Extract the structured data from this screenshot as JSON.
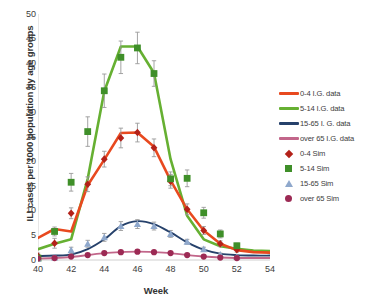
{
  "chart_data": {
    "type": "line",
    "title": "",
    "xlabel": "Week",
    "ylabel": "ILI cases per 1000 population by age groups",
    "xlim": [
      40,
      54
    ],
    "ylim": [
      0,
      50
    ],
    "xticks": [
      40,
      42,
      44,
      46,
      48,
      50,
      52,
      54
    ],
    "yticks": [
      0,
      5,
      10,
      15,
      20,
      25,
      30,
      35,
      40,
      45,
      50
    ],
    "grid": false,
    "legend_position": "right",
    "x": [
      40,
      41,
      42,
      43,
      44,
      45,
      46,
      47,
      48,
      49,
      50,
      51,
      52,
      53,
      54
    ],
    "series": [
      {
        "name": "0-4 I.G. data",
        "kind": "line",
        "color": "#e8491f",
        "values": [
          4.5,
          6.3,
          5.8,
          15.2,
          20.4,
          25.8,
          25.9,
          23.0,
          16.2,
          10.3,
          6.0,
          3.3,
          2.0,
          1.6,
          1.5
        ]
      },
      {
        "name": "5-14 I.G. data",
        "kind": "line",
        "color": "#66b032",
        "values": [
          2.2,
          3.3,
          4.2,
          16.5,
          34.3,
          43.4,
          43.4,
          38.0,
          20.5,
          9.0,
          4.2,
          2.8,
          2.3,
          1.9,
          1.8
        ]
      },
      {
        "name": "15-65 I. G. data",
        "kind": "line",
        "color": "#26416b",
        "values": [
          0.8,
          0.9,
          1.1,
          2.2,
          4.2,
          6.9,
          7.9,
          7.3,
          5.6,
          3.6,
          2.1,
          1.3,
          1.0,
          0.9,
          0.9
        ]
      },
      {
        "name": "over 65 I.G. data",
        "kind": "line",
        "color": "#c2668a",
        "values": [
          0.3,
          0.4,
          0.6,
          1.0,
          1.4,
          1.6,
          1.7,
          1.6,
          1.4,
          1.0,
          0.7,
          0.5,
          0.4,
          0.4,
          0.4
        ]
      },
      {
        "name": "0-4 Sim",
        "kind": "marker",
        "marker": "diamond",
        "color": "#b32119",
        "values": [
          0.8,
          3.4,
          9.5,
          15.4,
          20.5,
          24.8,
          25.9,
          22.8,
          16.0,
          10.3,
          6.0,
          3.3,
          2.1,
          null,
          null
        ],
        "errors": [
          0.6,
          1.0,
          1.1,
          1.5,
          1.6,
          2.0,
          1.9,
          1.8,
          1.4,
          1.1,
          0.8,
          0.6,
          0.5,
          null,
          null
        ]
      },
      {
        "name": "5-14 Sim",
        "kind": "marker",
        "marker": "square",
        "color": "#3f8f29",
        "values": [
          0.4,
          5.8,
          15.8,
          26.1,
          34.4,
          41.2,
          43.1,
          37.9,
          16.5,
          16.6,
          9.6,
          5.3,
          2.9,
          null,
          null
        ],
        "errors": [
          0.4,
          0.9,
          1.8,
          3.0,
          3.4,
          3.3,
          3.2,
          2.6,
          1.4,
          1.7,
          1.1,
          0.8,
          0.5,
          null,
          null
        ]
      },
      {
        "name": "15-65 Sim",
        "kind": "marker",
        "marker": "triangle",
        "color": "#8fa8cc",
        "values": [
          0.3,
          0.5,
          2.0,
          3.3,
          4.6,
          6.9,
          7.3,
          6.9,
          5.3,
          3.7,
          2.2,
          1.1,
          0.6,
          null,
          null
        ],
        "errors": [
          0.3,
          0.3,
          0.6,
          0.7,
          0.8,
          0.9,
          0.9,
          0.8,
          0.7,
          0.5,
          0.4,
          0.3,
          0.2,
          null,
          null
        ]
      },
      {
        "name": "over 65 Sim",
        "kind": "marker",
        "marker": "circle",
        "color": "#9c2a54",
        "values": [
          0.3,
          0.4,
          0.7,
          1.0,
          1.4,
          1.6,
          1.7,
          1.6,
          1.4,
          1.0,
          0.7,
          0.5,
          0.4,
          null,
          null
        ],
        "errors": [
          0.2,
          0.2,
          0.2,
          0.2,
          0.2,
          0.2,
          0.2,
          0.2,
          0.2,
          0.2,
          0.2,
          0.2,
          0.2,
          null,
          null
        ]
      }
    ]
  },
  "legend": {
    "items": [
      {
        "label": "0-4 I.G. data",
        "key": "line",
        "color": "#e8491f"
      },
      {
        "label": "5-14 I.G. data",
        "key": "line",
        "color": "#66b032"
      },
      {
        "label": "15-65 I. G. data",
        "key": "line",
        "color": "#26416b"
      },
      {
        "label": "over 65 I.G. data",
        "key": "line",
        "color": "#c2668a"
      },
      {
        "label": "0-4 Sim",
        "key": "di",
        "color": "#b32119"
      },
      {
        "label": "5-14 Sim",
        "key": "sq",
        "color": "#3f8f29"
      },
      {
        "label": "15-65 Sim",
        "key": "tr",
        "color": "#8fa8cc"
      },
      {
        "label": "over 65 Sim",
        "key": "ci",
        "color": "#9c2a54"
      }
    ]
  },
  "axes": {
    "error_bar_color": "#9a9a9a",
    "axis_line_color": "#d0d0d0"
  }
}
